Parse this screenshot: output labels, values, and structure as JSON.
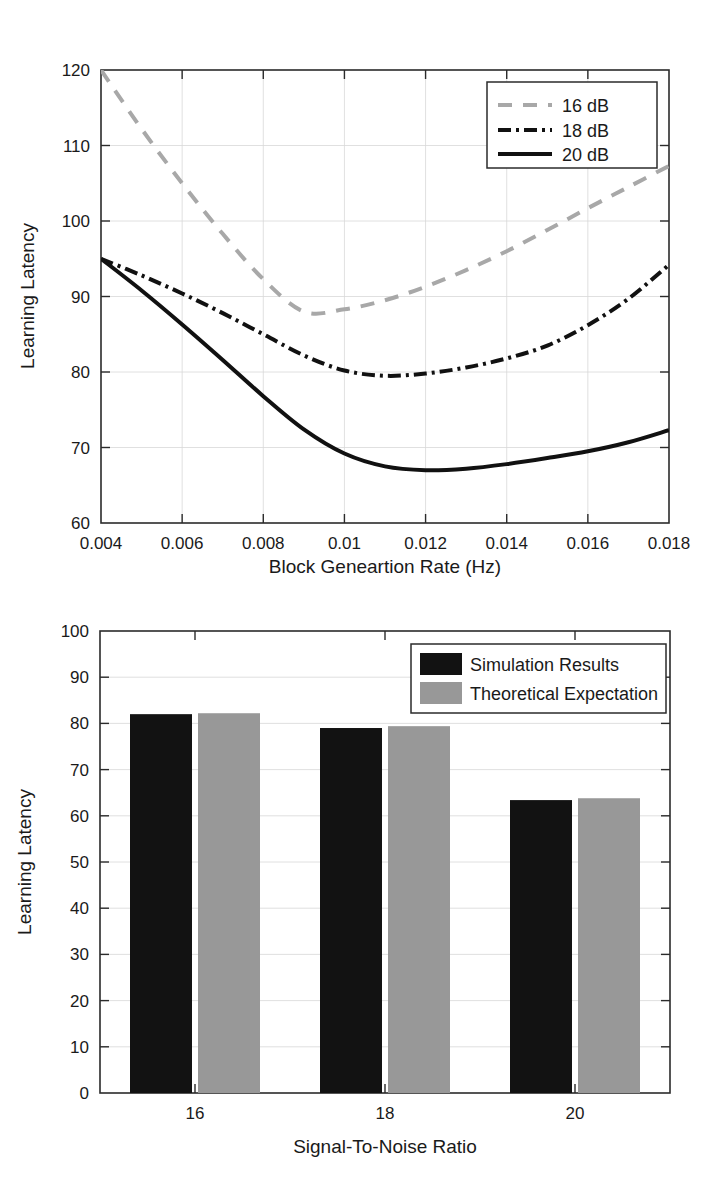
{
  "chart_data": [
    {
      "type": "line",
      "title": "",
      "xlabel": "Block Geneartion Rate (Hz)",
      "ylabel": "Learning Latency",
      "xlim": [
        0.004,
        0.018
      ],
      "ylim": [
        60,
        120
      ],
      "xticks": [
        0.004,
        0.006,
        0.008,
        0.01,
        0.012,
        0.014,
        0.016,
        0.018
      ],
      "xticklabels": [
        "0.004",
        "0.006",
        "0.008",
        "0.01",
        "0.012",
        "0.014",
        "0.016",
        "0.018"
      ],
      "yticks": [
        60,
        70,
        80,
        90,
        100,
        110,
        120
      ],
      "yticklabels": [
        "60",
        "70",
        "80",
        "90",
        "100",
        "110",
        "120"
      ],
      "grid": true,
      "legend_position": "upper right",
      "x": [
        0.004,
        0.005,
        0.006,
        0.007,
        0.008,
        0.009,
        0.01,
        0.011,
        0.012,
        0.013,
        0.014,
        0.015,
        0.016,
        0.017,
        0.018
      ],
      "series": [
        {
          "name": "16 dB",
          "color": "#a8a8a8",
          "linestyle": "dashed",
          "values": [
            120.0,
            112.2,
            105.0,
            98.3,
            92.3,
            88.0,
            88.3,
            89.5,
            91.3,
            93.5,
            96.0,
            98.8,
            101.7,
            104.5,
            107.3
          ]
        },
        {
          "name": "18 dB",
          "color": "#111111",
          "linestyle": "dashdot",
          "values": [
            95.0,
            92.8,
            90.4,
            87.8,
            85.0,
            82.2,
            80.2,
            79.5,
            79.8,
            80.6,
            81.8,
            83.5,
            86.2,
            89.7,
            94.2
          ]
        },
        {
          "name": "20 dB",
          "color": "#111111",
          "linestyle": "solid",
          "values": [
            95.0,
            90.8,
            86.3,
            81.6,
            76.8,
            72.4,
            69.2,
            67.5,
            67.0,
            67.2,
            67.8,
            68.6,
            69.5,
            70.7,
            72.3
          ]
        }
      ]
    },
    {
      "type": "bar",
      "title": "",
      "xlabel": "Signal-To-Noise Ratio",
      "ylabel": "Learning Latency",
      "ylim": [
        0,
        100
      ],
      "yticks": [
        0,
        10,
        20,
        30,
        40,
        50,
        60,
        70,
        80,
        90,
        100
      ],
      "yticklabels": [
        "0",
        "10",
        "20",
        "30",
        "40",
        "50",
        "60",
        "70",
        "80",
        "90",
        "100"
      ],
      "categories": [
        "16",
        "18",
        "20"
      ],
      "grid": true,
      "legend_position": "upper right",
      "series": [
        {
          "name": "Simulation Results",
          "color": "#121212",
          "values": [
            82.0,
            79.0,
            63.4
          ]
        },
        {
          "name": "Theoretical Expectation",
          "color": "#989898",
          "values": [
            82.2,
            79.4,
            63.8
          ]
        }
      ]
    }
  ]
}
